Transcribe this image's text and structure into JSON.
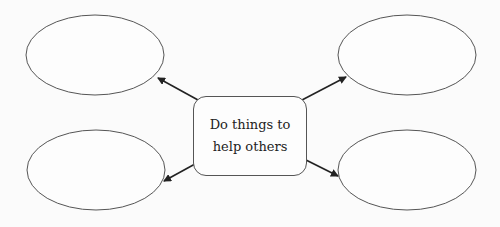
{
  "diagram": {
    "type": "mind-map",
    "center": {
      "lines": [
        "Do things to",
        "help others"
      ]
    },
    "nodes": [
      {
        "id": "top-left",
        "text": ""
      },
      {
        "id": "top-right",
        "text": ""
      },
      {
        "id": "bottom-left",
        "text": ""
      },
      {
        "id": "bottom-right",
        "text": ""
      }
    ],
    "colors": {
      "stroke": "#555555",
      "arrow": "#222222",
      "background": "#fbfbfb"
    }
  }
}
